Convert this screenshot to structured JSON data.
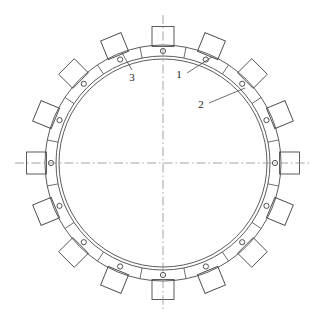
{
  "drawing": {
    "title": "Segmented ring assembly plan view",
    "background_color": "#ffffff",
    "line_color": "#4a4a4a",
    "centerline_color": "#8a8a8a",
    "center": {
      "x": 163,
      "y": 163
    },
    "geometry": {
      "inner_circle_radius": 104,
      "ring_inner_radius": 107,
      "ring_outer_radius": 118,
      "segment_count": 16,
      "tab_count": 16,
      "bolt_hole_count": 16,
      "bolt_hole_radius": 2.6,
      "bolt_hole_circle_radius": 112,
      "tab_width": 22,
      "tab_height": 20,
      "segment_angle_deg": 22.5,
      "joint_offset_deg": 11.25
    },
    "centerlines": {
      "vertical_label": "vertical-centerline",
      "horizontal_label": "horizontal-centerline",
      "extent": 148
    },
    "labels": [
      {
        "id": "1",
        "text": "1",
        "x": 179,
        "y": 75,
        "leader_from": {
          "x": 187,
          "y": 73
        },
        "leader_to": {
          "x": 212,
          "y": 57
        },
        "target": "ring-body"
      },
      {
        "id": "2",
        "text": "2",
        "x": 201,
        "y": 105,
        "leader_from": {
          "x": 209,
          "y": 103
        },
        "leader_to": {
          "x": 245,
          "y": 88
        },
        "target": "segment-joint"
      },
      {
        "id": "3",
        "text": "3",
        "x": 132,
        "y": 78,
        "leader_from": {
          "x": 132,
          "y": 70
        },
        "leader_to": {
          "x": 122,
          "y": 53
        },
        "target": "bolt-hole"
      }
    ]
  }
}
